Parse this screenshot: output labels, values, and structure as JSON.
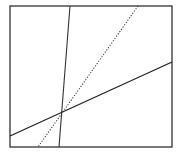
{
  "diagram": {
    "width": 180,
    "height": 155,
    "background": "#ffffff",
    "frame": {
      "x": 10,
      "y": 6,
      "width": 162,
      "height": 141,
      "stroke": "#333333",
      "stroke_width": 1.3
    },
    "lines": [
      {
        "name": "steep-solid-line",
        "style": "solid",
        "x1": 70,
        "y1": 6,
        "x2": 59,
        "y2": 147,
        "stroke": "#333333",
        "stroke_width": 1.1
      },
      {
        "name": "dotted-line",
        "style": "dotted",
        "x1": 138,
        "y1": 6,
        "x2": 38,
        "y2": 147,
        "stroke": "#444444",
        "stroke_width": 1.1,
        "dasharray": "1.2 1.6"
      },
      {
        "name": "shallow-solid-line",
        "style": "solid",
        "x1": 10,
        "y1": 136,
        "x2": 172,
        "y2": 62,
        "stroke": "#222222",
        "stroke_width": 1.3
      }
    ],
    "intersection": {
      "x": 61,
      "y": 114
    }
  }
}
